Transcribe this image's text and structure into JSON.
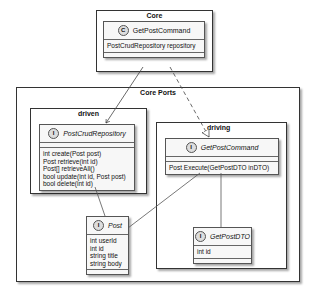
{
  "packages": {
    "core": {
      "title": "Core"
    },
    "core_ports": {
      "title": "Core Ports"
    },
    "driven": {
      "title": "driven"
    },
    "driving": {
      "title": "driving"
    }
  },
  "classes": {
    "get_post_command_class": {
      "stereotype": "C",
      "name": "GetPostCommand",
      "members": [
        "PostCrudRepository repository"
      ]
    },
    "post_crud_repository": {
      "stereotype": "I",
      "name": "PostCrudRepository",
      "members": [
        "int create(Post post)",
        "Post retrieve(int id)",
        "Post[] retrieveAll()",
        "bool update(int id, Post post)",
        "bool delete(int id)"
      ]
    },
    "get_post_command_interface": {
      "stereotype": "I",
      "name": "GetPostCommand",
      "members": [
        "Post Execute(GetPostDTO inDTO)"
      ]
    },
    "post": {
      "stereotype": "I",
      "name": "Post",
      "members": [
        "int userId",
        "int id",
        "string title",
        "string body"
      ]
    },
    "get_post_dto": {
      "stereotype": "I",
      "name": "GetPostDTO",
      "members": [
        "int id"
      ]
    }
  },
  "relations": [
    {
      "from": "GetPostCommand (class)",
      "to": "PostCrudRepository",
      "type": "association-arrow"
    },
    {
      "from": "GetPostCommand (class)",
      "to": "GetPostCommand (interface)",
      "type": "realization"
    },
    {
      "from": "PostCrudRepository",
      "to": "Post",
      "type": "association"
    },
    {
      "from": "GetPostCommand (interface)",
      "to": "Post",
      "type": "association"
    },
    {
      "from": "GetPostCommand (interface)",
      "to": "GetPostDTO",
      "type": "association"
    }
  ]
}
